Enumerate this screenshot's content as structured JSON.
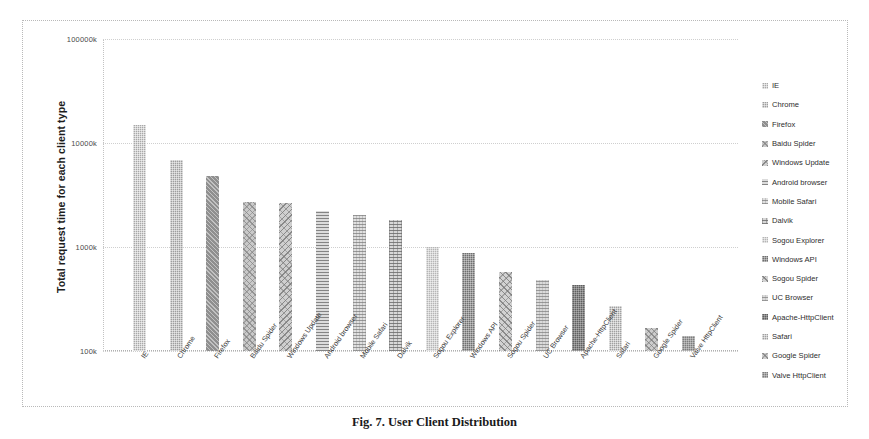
{
  "chart_data": {
    "type": "bar",
    "title": "",
    "xlabel": "",
    "ylabel": "Total request time for each  client type",
    "yscale": "log",
    "ylim": [
      100,
      100000
    ],
    "yunit": "k",
    "ytick_labels": [
      "100000k",
      "10000k",
      "1000k",
      "100k"
    ],
    "ytick_values": [
      100000,
      10000,
      1000,
      100
    ],
    "grid": true,
    "legend_position": "right",
    "categories": [
      "IE",
      "Chrome",
      "Firefox",
      "Baidu Spider",
      "Windows Update",
      "Android browser",
      "Mobile Safari",
      "Dalvik",
      "Sogou Explorer",
      "Windows API",
      "Sogou Spider",
      "UC Browser",
      "Apache-HttpClient",
      "Safari",
      "Google Spider",
      "Valve HttpClient"
    ],
    "values": [
      15000,
      6800,
      4800,
      2700,
      2650,
      2200,
      2050,
      1800,
      1000,
      880,
      570,
      480,
      430,
      270,
      165,
      140
    ],
    "series": [
      {
        "name": "Total request time",
        "values": [
          15000,
          6800,
          4800,
          2700,
          2650,
          2200,
          2050,
          1800,
          1000,
          880,
          570,
          480,
          430,
          270,
          165,
          140
        ]
      }
    ]
  },
  "axis": {
    "y_title": "Total request time for each  client type",
    "ticks": [
      {
        "label": "100000k",
        "value": 100000
      },
      {
        "label": "10000k",
        "value": 10000
      },
      {
        "label": "1000k",
        "value": 1000
      },
      {
        "label": "100k",
        "value": 100
      }
    ]
  },
  "bars": [
    {
      "label": "IE",
      "value": 15000,
      "pattern": "p0"
    },
    {
      "label": "Chrome",
      "value": 6800,
      "pattern": "p1"
    },
    {
      "label": "Firefox",
      "value": 4800,
      "pattern": "p2"
    },
    {
      "label": "Baidu Spider",
      "value": 2700,
      "pattern": "p3"
    },
    {
      "label": "Windows Update",
      "value": 2650,
      "pattern": "p4"
    },
    {
      "label": "Android browser",
      "value": 2200,
      "pattern": "p5"
    },
    {
      "label": "Mobile Safari",
      "value": 2050,
      "pattern": "p6"
    },
    {
      "label": "Dalvik",
      "value": 1800,
      "pattern": "p7"
    },
    {
      "label": "Sogou Explorer",
      "value": 1000,
      "pattern": "p8"
    },
    {
      "label": "Windows API",
      "value": 880,
      "pattern": "p9"
    },
    {
      "label": "Sogou Spider",
      "value": 570,
      "pattern": "p10"
    },
    {
      "label": "UC Browser",
      "value": 480,
      "pattern": "p11"
    },
    {
      "label": "Apache-HttpClient",
      "value": 430,
      "pattern": "p12"
    },
    {
      "label": "Safari",
      "value": 270,
      "pattern": "p13"
    },
    {
      "label": "Google Spider",
      "value": 165,
      "pattern": "p14"
    },
    {
      "label": "Valve HttpClient",
      "value": 140,
      "pattern": "p15"
    }
  ],
  "legend": {
    "items": [
      {
        "label": "IE",
        "pattern": "p0"
      },
      {
        "label": "Chrome",
        "pattern": "p1"
      },
      {
        "label": "Firefox",
        "pattern": "p2"
      },
      {
        "label": "Baidu Spider",
        "pattern": "p3"
      },
      {
        "label": "Windows Update",
        "pattern": "p4"
      },
      {
        "label": "Android browser",
        "pattern": "p5"
      },
      {
        "label": "Mobile Safari",
        "pattern": "p6"
      },
      {
        "label": "Dalvik",
        "pattern": "p7"
      },
      {
        "label": "Sogou Explorer",
        "pattern": "p8"
      },
      {
        "label": "Windows API",
        "pattern": "p9"
      },
      {
        "label": "Sogou Spider",
        "pattern": "p10"
      },
      {
        "label": "UC Browser",
        "pattern": "p11"
      },
      {
        "label": "Apache-HttpClient",
        "pattern": "p12"
      },
      {
        "label": "Safari",
        "pattern": "p13"
      },
      {
        "label": "Google Spider",
        "pattern": "p14"
      },
      {
        "label": "Valve HttpClient",
        "pattern": "p15"
      }
    ]
  },
  "caption": {
    "text": "Fig. 7. User Client Distribution"
  }
}
